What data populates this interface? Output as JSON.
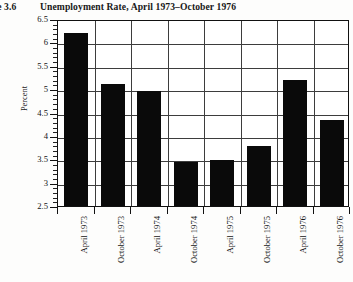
{
  "figure": {
    "number_label": "re 3.6",
    "title": "Unemployment Rate, April 1973–October 1976"
  },
  "axes": {
    "ylabel": "Percent",
    "xlabel": ""
  },
  "chart_data": {
    "type": "bar",
    "title": "Unemployment Rate, April 1973–October 1976",
    "xlabel": "",
    "ylabel": "Percent",
    "categories": [
      "April 1973",
      "October 1973",
      "April 1974",
      "October 1974",
      "April 1975",
      "October 1975",
      "April 1976",
      "October 1976"
    ],
    "values": [
      6.2,
      5.1,
      4.95,
      3.45,
      3.48,
      3.78,
      5.2,
      4.35
    ],
    "ylim": [
      2.5,
      6.5
    ],
    "ytick_labels": [
      "2.5",
      "3",
      "3.5",
      "4",
      "4.5",
      "5",
      "5.5",
      "6",
      "6.5"
    ],
    "ytick_values": [
      2.5,
      3,
      3.5,
      4,
      4.5,
      5,
      5.5,
      6,
      6.5
    ],
    "minor_ticks": true,
    "grid": "both",
    "legend": "none",
    "bar_color": "#0a0a0a",
    "grid_color": "#3d3d3d",
    "axis_color": "#111111"
  }
}
